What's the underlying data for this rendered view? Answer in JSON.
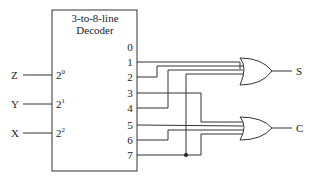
{
  "decoder": {
    "title_line1": "3-to-8-line",
    "title_line2": "Decoder",
    "inputs": [
      {
        "signal": "Z",
        "base": "2",
        "exp": "0"
      },
      {
        "signal": "Y",
        "base": "2",
        "exp": "1"
      },
      {
        "signal": "X",
        "base": "2",
        "exp": "2"
      }
    ],
    "outputs": [
      "0",
      "1",
      "2",
      "3",
      "4",
      "5",
      "6",
      "7"
    ]
  },
  "gates": [
    {
      "type": "OR",
      "output": "S",
      "inputs": [
        "1",
        "2",
        "4",
        "7"
      ]
    },
    {
      "type": "OR",
      "output": "C",
      "inputs": [
        "3",
        "5",
        "6",
        "7"
      ]
    }
  ],
  "colors": {
    "line": "#333333",
    "background": "#ffffff"
  }
}
